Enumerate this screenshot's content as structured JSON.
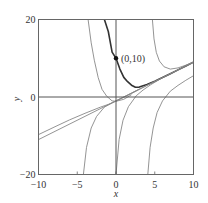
{
  "chart_data": {
    "type": "line",
    "title": "",
    "xlabel": "x",
    "ylabel": "y",
    "xlim": [
      -10,
      10
    ],
    "ylim": [
      -20,
      20
    ],
    "xticks": [
      -10,
      -5,
      0,
      5,
      10
    ],
    "xtick_labels": [
      "−10",
      "−5",
      "0",
      "5",
      "10"
    ],
    "yticks": [
      -20,
      0,
      20
    ],
    "ytick_labels": [
      "−20",
      "0",
      "20"
    ],
    "grid": false,
    "legend": null,
    "zero_lines": true,
    "annotation": {
      "text": "(0,10)",
      "x": 0,
      "y": 10
    },
    "series": [
      {
        "name": "highlighted solution through (0,10)",
        "style": "dark",
        "points": [
          [
            -1.5,
            20
          ],
          [
            -1,
            16.9
          ],
          [
            -0.5,
            11.6
          ],
          [
            0,
            10
          ],
          [
            0.5,
            7.2
          ],
          [
            1,
            5.05
          ],
          [
            1.5,
            3.95
          ],
          [
            2,
            3.05
          ],
          [
            2.5,
            2.5
          ],
          [
            3,
            2.55
          ],
          [
            4,
            3.2
          ],
          [
            5,
            4.07
          ],
          [
            6,
            5.03
          ],
          [
            7,
            6.01
          ],
          [
            8,
            7.0
          ],
          [
            9,
            8.0
          ],
          [
            10,
            9.0
          ]
        ]
      },
      {
        "name": "asymptote line",
        "style": "light",
        "points": [
          [
            -10,
            -11
          ],
          [
            10,
            9
          ]
        ]
      },
      {
        "name": "solution top-left",
        "style": "light",
        "points": [
          [
            -3.6,
            20
          ],
          [
            -3.2,
            14
          ],
          [
            -2.8,
            9.5
          ],
          [
            -2.3,
            5
          ],
          [
            -1.8,
            2
          ],
          [
            -1.2,
            0.2
          ],
          [
            -0.5,
            -1
          ],
          [
            0,
            -1.1
          ],
          [
            1,
            -0.6
          ],
          [
            2,
            0.6
          ]
        ]
      },
      {
        "name": "solution top-right",
        "style": "light",
        "points": [
          [
            4.7,
            20
          ],
          [
            4.9,
            15
          ],
          [
            5.2,
            11.5
          ],
          [
            5.6,
            9.3
          ],
          [
            6.2,
            7.8
          ],
          [
            7,
            7.2
          ],
          [
            8,
            7.5
          ],
          [
            9,
            8.2
          ],
          [
            10,
            9.05
          ]
        ]
      },
      {
        "name": "solution from left edge",
        "style": "light",
        "points": [
          [
            -10,
            -9.7
          ],
          [
            -8,
            -7.8
          ],
          [
            -6,
            -5.9
          ],
          [
            -4,
            -4.2
          ],
          [
            -2,
            -2.6
          ],
          [
            -1,
            -1.9
          ],
          [
            0,
            -1.05
          ],
          [
            2,
            0.9
          ],
          [
            4,
            3
          ],
          [
            6,
            5
          ],
          [
            8,
            7
          ],
          [
            10,
            9
          ]
        ]
      },
      {
        "name": "solution bottom-left",
        "style": "light",
        "points": [
          [
            -4.2,
            -20
          ],
          [
            -3.8,
            -13
          ],
          [
            -3.2,
            -8
          ],
          [
            -2.5,
            -5
          ],
          [
            -1.5,
            -2.6
          ],
          [
            0,
            -1
          ],
          [
            1,
            0
          ],
          [
            2,
            1
          ],
          [
            3,
            2.05
          ]
        ]
      },
      {
        "name": "solution bottom-middle",
        "style": "light",
        "points": [
          [
            0,
            -20
          ],
          [
            0.4,
            -11
          ],
          [
            0.9,
            -6
          ],
          [
            1.6,
            -2.5
          ],
          [
            2.6,
            0.3
          ],
          [
            3.5,
            1.8
          ],
          [
            4.5,
            3.2
          ],
          [
            5.5,
            4.4
          ]
        ]
      },
      {
        "name": "solution bottom-right",
        "style": "light",
        "points": [
          [
            4.1,
            -20
          ],
          [
            4.4,
            -13
          ],
          [
            4.8,
            -8
          ],
          [
            5.3,
            -4
          ],
          [
            6,
            -1
          ],
          [
            7,
            1.5
          ],
          [
            8,
            3
          ],
          [
            9,
            4.3
          ],
          [
            10,
            5.5
          ]
        ]
      }
    ]
  },
  "labels": {
    "annotation": "(0,10)",
    "xlabel": "x",
    "ylabel": "y"
  }
}
